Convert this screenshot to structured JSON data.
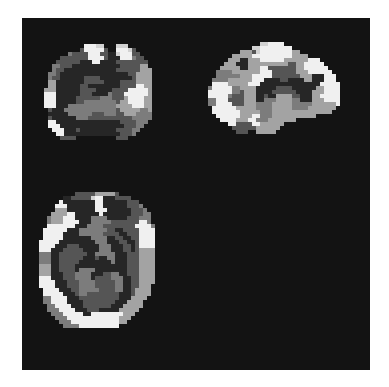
{
  "figure": {
    "background_color": "#131313",
    "page_color": "#ffffff",
    "voxel_size_px": 4,
    "palette": {
      "0": null,
      "1": "#262626",
      "2": "#555555",
      "3": "#7c7c7c",
      "4": "#a3a3a3",
      "5": "#d2d2d2",
      "6": "#f0f0f0"
    },
    "views": [
      {
        "id": "coronal",
        "name": "coronal-slice",
        "rows": [
          "00000000000000000000000000000",
          "00000000000666550005550000000",
          "00000000002666662006665200000",
          "00000003222266622115666220000",
          "00000222222266662111666322000",
          "00002222221116611112222222200",
          "00033222111111111111222224400",
          "00032211111111111112222224440",
          "00332111111111111111112244440",
          "00322111111222211111111244440",
          "00441111111222221111222244440",
          "00441111112211111111222266440",
          "04441111112222111122226666640",
          "06661111112221111322266666640",
          "06661111122222233322246666440",
          "06661111122333333332446666440",
          "06661113333333333334444666440",
          "00211133333333333332444443340",
          "00111113333332223332244433330",
          "00211111133322222222222333330",
          "00661111111111111111222233300",
          "00666111111111111111122233000",
          "00066611121111111112222330000",
          "00006611111111111111222300000",
          "00000222200000000002220000000",
          "00000000000000000000000000000"
        ]
      },
      {
        "id": "sagittal",
        "name": "sagittal-slice",
        "rows": [
          "000000000000000000000000000000000000",
          "000000000000000556666000000000000000",
          "000000000000055666666660000000000000",
          "000000000044425666666664400000000000",
          "000000004444466666666664444000000000",
          "000000044411444666666444444666000000",
          "000000444111444444444422446666600000",
          "000004444411444662222222446666660000",
          "000033334444444666222222444666666000",
          "000033333344466666222222244411166600",
          "000333344444466611112211114411166600",
          "000666644444666111111111111111666660",
          "003666663344441111122221111114466660",
          "006666663324441111222222111144466660",
          "006666632224441121144442211144666660",
          "003366622224441133344443311144466660",
          "003366662224443333444443333344444460",
          "000666666444443333444443333444444400",
          "000666666644444333444444444444444000",
          "000066666644466333444444444440000000",
          "000006666444663334444444000000000000",
          "000000066222266444444000000000000000",
          "000000002222224444440000000000000000",
          "000000000222004444400000000000000000",
          "000000000000000000000000000000000000"
        ]
      },
      {
        "id": "axial",
        "name": "axial-slice",
        "rows": [
          "0000000000000000000000000000000",
          "0000000000222224444420000000000",
          "0000000112222256611122220000000",
          "0000006111111116611111122200000",
          "0000066611111116611111122230000",
          "0000044411111116661111112223000",
          "0000444466111111611111112223300",
          "0003444666111133331111122233300",
          "0003444666611133333222222266300",
          "0006666666111333322222222666630",
          "0066666611133333332211222266660",
          "0066666111133333322221122266660",
          "0066666111111133331122112266660",
          "0666661111111113331112211266660",
          "0666611122211111333111221266660",
          "0666111222221111333111221244440",
          "0333112222222113333311122244440",
          "0333112222221112113311122244440",
          "0333112222211111111311122244440",
          "0444112222111111111111122244440",
          "0444112222133331111111122244440",
          "0444111222333311122331122244440",
          "0666111222333312222333112244440",
          "0666611122233332222233112244440",
          "0666611122233332222233112244400",
          "0066661112233333222233112444400",
          "0066666111233222222221112444400",
          "0033666611122222222221114444000",
          "0033666611112222222211144440000",
          "0003366661112222222111444440000",
          "0003336666111222111114444400000",
          "0000333666661166666666444000000",
          "0000033366666666666664440000000",
          "0000003336666666666664400000000",
          "0000000333366666666660000000000",
          "0000000000000000000000000000000"
        ]
      }
    ]
  }
}
